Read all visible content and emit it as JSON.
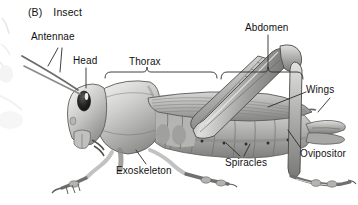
{
  "figure": {
    "panel_label": "(B)",
    "panel_title": "Insect",
    "background_color": "#ffffff",
    "line_color": "#2b2b2b",
    "text_color": "#111111"
  },
  "labels": {
    "antennae": "Antennae",
    "head": "Head",
    "thorax": "Thorax",
    "abdomen": "Abdomen",
    "wings": "Wings",
    "ovipositor": "Ovipositor",
    "spiracles": "Spiracles",
    "exoskeleton": "Exoskeleton"
  },
  "callouts": [
    {
      "name": "antennae",
      "text": "Antennae",
      "x": 31,
      "y": 36,
      "leader": "two-branch"
    },
    {
      "name": "head",
      "text": "Head",
      "x": 74,
      "y": 55,
      "leader": "vertical"
    },
    {
      "name": "thorax",
      "text": "Thorax",
      "x": 129,
      "y": 55,
      "leader": "brace"
    },
    {
      "name": "abdomen",
      "text": "Abdomen",
      "x": 247,
      "y": 22,
      "leader": "brace"
    },
    {
      "name": "wings",
      "text": "Wings",
      "x": 308,
      "y": 86,
      "leader": "two-branch"
    },
    {
      "name": "ovipositor",
      "text": "Ovipositor",
      "x": 302,
      "y": 149,
      "leader": "diagonal"
    },
    {
      "name": "spiracles",
      "text": "Spiracles",
      "x": 226,
      "y": 158,
      "leader": "two-branch"
    },
    {
      "name": "exoskeleton",
      "text": "Exoskeleton",
      "x": 117,
      "y": 166,
      "leader": "diagonal"
    }
  ],
  "anatomy_parts": [
    "antenna-left",
    "antenna-right",
    "compound-eye",
    "head-capsule",
    "mouthparts",
    "pronotum",
    "thorax",
    "abdomen-segments",
    "spiracle-dots",
    "forewing-tegmen",
    "hindwing",
    "foreleg",
    "midleg",
    "hindleg-femur",
    "hindleg-tibia",
    "hindleg-tarsus",
    "ovipositor-valves",
    "cerci"
  ]
}
